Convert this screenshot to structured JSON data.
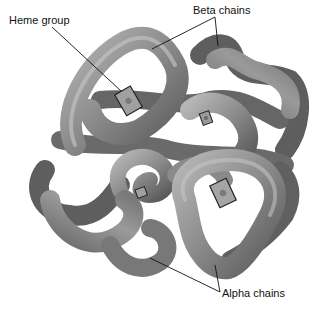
{
  "figure": {
    "labels": {
      "heme": "Heme group",
      "beta": "Beta chains",
      "alpha": "Alpha chains"
    },
    "colors": {
      "tube_dark": "#5e5e5e",
      "tube_mid": "#8a8a8a",
      "tube_light": "#b8b8b8",
      "heme": "#9a9a9a",
      "leader_line": "#111111",
      "background": "#ffffff"
    }
  }
}
